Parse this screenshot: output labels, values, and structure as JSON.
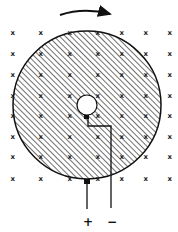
{
  "diagram": {
    "type": "faraday-disk",
    "rotation_arrow": {
      "direction": "clockwise"
    },
    "field_marker": "x",
    "field_grid": {
      "columns": [
        13,
        41,
        70,
        98,
        122,
        146,
        170
      ],
      "rows": [
        32,
        53,
        74,
        95,
        115,
        136,
        156,
        178
      ]
    },
    "disk": {
      "cx": 87,
      "cy": 105,
      "r": 74,
      "fill": "hatched"
    },
    "axle_hole": {
      "cx": 87,
      "cy": 105,
      "r": 10
    },
    "terminals": {
      "positive": {
        "label": "+"
      },
      "negative": {
        "label": "−"
      }
    },
    "colors": {
      "ink": "#1a1a1a",
      "background": "#ffffff"
    }
  }
}
